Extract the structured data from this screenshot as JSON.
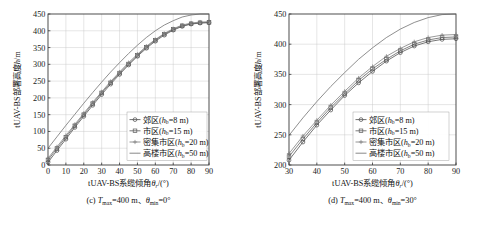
{
  "figure": {
    "panels": [
      {
        "id": "panel-c",
        "caption_label": "(c)",
        "caption_body": "Tmax=400 m、θmin=0°",
        "caption_full": "(c) Tmax=400 m、θmin=0°",
        "xlabel": "tUAV-BS系缆倾角θr/(°)",
        "ylabel": "tUAV-BS部署高度h/m"
      },
      {
        "id": "panel-d",
        "caption_label": "(d)",
        "caption_body": "Tmax=400 m、θmin=30°",
        "caption_full": "(d) Tmax=400 m、θmin=30°",
        "xlabel": "tUAV-BS系缆倾角θr/(°)",
        "ylabel": "tUAV-BS部署高度h/m"
      }
    ]
  },
  "chart_data": [
    {
      "type": "line",
      "id": "panel-c",
      "title": "(c) Tmax=400 m、θmin=0°",
      "xlabel": "tUAV-BS系缆倾角θr/(°)",
      "ylabel": "tUAV-BS部署高度h/m",
      "xlim": [
        0,
        90
      ],
      "ylim": [
        0,
        450
      ],
      "xticks": [
        0,
        10,
        20,
        30,
        40,
        50,
        60,
        70,
        80,
        90
      ],
      "yticks": [
        0,
        50,
        100,
        150,
        200,
        250,
        300,
        350,
        400,
        450
      ],
      "grid": true,
      "legend_position": "lower-right",
      "x": [
        0,
        5,
        10,
        15,
        20,
        25,
        30,
        35,
        40,
        45,
        50,
        55,
        60,
        65,
        70,
        75,
        80,
        85,
        90
      ],
      "series": [
        {
          "name": "郊区(hb=8 m)",
          "label_main": "郊区",
          "label_param": "hb",
          "label_value": "=8 m",
          "marker": "circle",
          "color": "#4a4a4a",
          "values": [
            8,
            43,
            77,
            112,
            145,
            178,
            210,
            241,
            270,
            298,
            324,
            348,
            369,
            387,
            402,
            413,
            420,
            423,
            424
          ]
        },
        {
          "name": "市区(hb=15 m)",
          "label_main": "市区",
          "label_param": "hb",
          "label_value": "=15 m",
          "marker": "square",
          "color": "#5a5a5a",
          "values": [
            15,
            49,
            83,
            117,
            150,
            183,
            215,
            245,
            274,
            301,
            327,
            351,
            372,
            390,
            404,
            415,
            421,
            424,
            425
          ]
        },
        {
          "name": "密集市区(hb=20 m)",
          "label_main": "密集市区",
          "label_param": "hb",
          "label_value": "=20 m",
          "marker": "plus",
          "color": "#787878",
          "values": [
            20,
            54,
            88,
            121,
            154,
            187,
            218,
            249,
            277,
            305,
            330,
            354,
            374,
            392,
            406,
            417,
            423,
            426,
            427
          ]
        },
        {
          "name": "高楼市区(hb=50 m)",
          "label_main": "高楼市区",
          "label_param": "hb",
          "label_value": "=50 m",
          "marker": "none",
          "color": "#6a6a6a",
          "values": [
            50,
            84,
            118,
            151,
            184,
            216,
            247,
            277,
            305,
            332,
            357,
            380,
            400,
            417,
            430,
            441,
            447,
            450,
            450
          ]
        }
      ]
    },
    {
      "type": "line",
      "id": "panel-d",
      "title": "(d) Tmax=400 m、θmin=30°",
      "xlabel": "tUAV-BS系缆倾角θr/(°)",
      "ylabel": "tUAV-BS部署高度h/m",
      "xlim": [
        30,
        90
      ],
      "ylim": [
        200,
        450
      ],
      "xticks": [
        30,
        40,
        50,
        60,
        70,
        80,
        90
      ],
      "yticks": [
        200,
        250,
        300,
        350,
        400,
        450
      ],
      "grid": true,
      "legend_position": "lower-right",
      "x": [
        30,
        35,
        40,
        45,
        50,
        55,
        60,
        65,
        70,
        75,
        80,
        85,
        90
      ],
      "series": [
        {
          "name": "郊区(hb=8 m)",
          "label_main": "郊区",
          "label_param": "hb",
          "label_value": "=8 m",
          "marker": "circle",
          "color": "#4a4a4a",
          "values": [
            208,
            238,
            266,
            291,
            315,
            336,
            355,
            372,
            386,
            397,
            404,
            408,
            409
          ]
        },
        {
          "name": "市区(hb=15 m)",
          "label_main": "市区",
          "label_param": "hb",
          "label_value": "=15 m",
          "marker": "square",
          "color": "#5a5a5a",
          "values": [
            214,
            243,
            270,
            295,
            318,
            340,
            359,
            375,
            389,
            400,
            407,
            411,
            412
          ]
        },
        {
          "name": "密集市区(hb=20 m)",
          "label_main": "密集市区",
          "label_param": "hb",
          "label_value": "=20 m",
          "marker": "plus",
          "color": "#787878",
          "values": [
            219,
            248,
            274,
            299,
            322,
            344,
            363,
            380,
            393,
            404,
            411,
            415,
            416
          ]
        },
        {
          "name": "高楼市区(hb=50 m)",
          "label_main": "高楼市区",
          "label_param": "hb",
          "label_value": "=50 m",
          "marker": "none",
          "color": "#6a6a6a",
          "values": [
            249,
            278,
            305,
            330,
            353,
            375,
            394,
            411,
            425,
            436,
            444,
            449,
            450
          ]
        }
      ]
    }
  ]
}
